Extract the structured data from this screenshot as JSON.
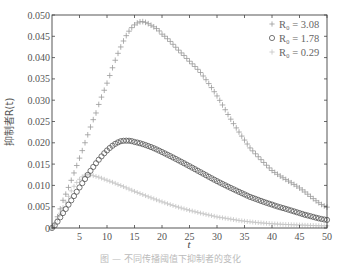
{
  "chart_data": {
    "type": "scatter",
    "title": "",
    "xlabel": "t",
    "ylabel": "抑制者R(t)",
    "xlim": [
      0,
      50
    ],
    "ylim": [
      0,
      0.05
    ],
    "xticks": [
      5,
      10,
      15,
      20,
      25,
      30,
      35,
      40,
      45,
      50
    ],
    "xtick_labels": [
      "5",
      "10",
      "15",
      "20",
      "25",
      "30",
      "35",
      "40",
      "45",
      "50"
    ],
    "yticks": [
      0,
      0.005,
      0.01,
      0.015,
      0.02,
      0.025,
      0.03,
      0.035,
      0.04,
      0.045,
      0.05
    ],
    "ytick_labels": [
      "0",
      "0.005",
      "0.010",
      "0.015",
      "0.020",
      "0.025",
      "0.030",
      "0.035",
      "0.040",
      "0.045",
      "0.050"
    ],
    "grid": false,
    "legend_position": "upper right",
    "series": [
      {
        "name": "R0=3.08",
        "legend_label": "R₀ = 3.08",
        "marker": "plus",
        "color": "#9a9a9a",
        "x": [
          0,
          2,
          5,
          8,
          10,
          12,
          14,
          16,
          18,
          20,
          24,
          27,
          30,
          33,
          36,
          40,
          45,
          50
        ],
        "y": [
          0,
          0.0065,
          0.0164,
          0.027,
          0.034,
          0.041,
          0.0462,
          0.0484,
          0.0476,
          0.0455,
          0.0405,
          0.0365,
          0.031,
          0.0245,
          0.0188,
          0.0135,
          0.0094,
          0.0049
        ]
      },
      {
        "name": "R0=1.78",
        "legend_label": "R₀ = 1.78",
        "marker": "circle",
        "color": "#555555",
        "x": [
          0,
          2,
          4,
          6,
          8,
          10,
          12,
          13.5,
          15,
          18,
          21,
          24,
          27,
          30,
          33,
          36,
          40,
          43,
          46,
          50
        ],
        "y": [
          0,
          0.0035,
          0.0075,
          0.0115,
          0.0152,
          0.0182,
          0.0201,
          0.0205,
          0.0202,
          0.019,
          0.0172,
          0.0152,
          0.0131,
          0.011,
          0.0091,
          0.0073,
          0.0055,
          0.0043,
          0.0031,
          0.0019
        ]
      },
      {
        "name": "R0=0.29",
        "legend_label": "R₀ = 0.29",
        "marker": "plus",
        "color": "#c4c4c4",
        "x": [
          0,
          2,
          4,
          6,
          8,
          10,
          12,
          15,
          18,
          21,
          24,
          27,
          30,
          35,
          40,
          45,
          50
        ],
        "y": [
          0,
          0.0048,
          0.0098,
          0.0124,
          0.0121,
          0.0112,
          0.0102,
          0.0086,
          0.0071,
          0.0057,
          0.0045,
          0.0035,
          0.0026,
          0.0016,
          0.001,
          0.0007,
          0.0005
        ]
      }
    ]
  },
  "caption": "图 — 不同传播阈值下抑制者的变化"
}
